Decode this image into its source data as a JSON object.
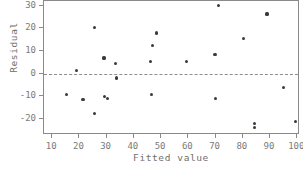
{
  "chart_data": {
    "type": "scatter",
    "title": "",
    "xlabel": "Fitted value",
    "ylabel": "Residual",
    "xlim": [
      7,
      101
    ],
    "ylim": [
      -27,
      32
    ],
    "xticks": [
      10,
      20,
      30,
      40,
      50,
      60,
      70,
      80,
      90,
      100
    ],
    "yticks": [
      30,
      20,
      10,
      0,
      -10,
      -20
    ],
    "xtick_labels": [
      "10",
      "20",
      "30",
      "40",
      "50",
      "60",
      "70",
      "80",
      "90",
      "100"
    ],
    "ytick_labels": [
      "30",
      "20",
      "10",
      "0",
      "-10",
      "-20"
    ],
    "grid": false,
    "legend": null,
    "reference_lines": [
      {
        "name": "zero-residual-line",
        "orientation": "horizontal",
        "y": 0,
        "style": "dashed",
        "color": "#8d8d8d"
      }
    ],
    "marker": {
      "shape": "circle",
      "color": "#3a3a3a",
      "size": 3.2
    },
    "points": [
      {
        "x": 15.4,
        "y": -9.0
      },
      {
        "x": 18.8,
        "y": 1.4
      },
      {
        "x": 21.3,
        "y": -11.2
      },
      {
        "x": 25.5,
        "y": 20.5
      },
      {
        "x": 25.6,
        "y": -17.7
      },
      {
        "x": 29.0,
        "y": 6.9
      },
      {
        "x": 29.1,
        "y": -10.2
      },
      {
        "x": 30.4,
        "y": -11.0
      },
      {
        "x": 33.4,
        "y": 4.4
      },
      {
        "x": 33.5,
        "y": -1.9
      },
      {
        "x": 46.2,
        "y": 5.4
      },
      {
        "x": 46.4,
        "y": -9.2
      },
      {
        "x": 46.8,
        "y": 12.4
      },
      {
        "x": 48.3,
        "y": 17.9
      },
      {
        "x": 59.4,
        "y": 5.4
      },
      {
        "x": 69.8,
        "y": 8.6
      },
      {
        "x": 69.9,
        "y": -10.8
      },
      {
        "x": 71.0,
        "y": 29.9
      },
      {
        "x": 80.4,
        "y": 15.4
      },
      {
        "x": 84.3,
        "y": -21.8
      },
      {
        "x": 84.4,
        "y": -23.6
      },
      {
        "x": 88.9,
        "y": 26.3
      },
      {
        "x": 95.0,
        "y": -6.1
      },
      {
        "x": 99.3,
        "y": -20.9
      }
    ],
    "n_points": 24,
    "colors": {
      "marker": "#3a3a3a",
      "axis": "#8a8a8a",
      "text": "#7a7a7a",
      "reference_line": "#8d8d8d",
      "background": "#ffffff"
    }
  }
}
